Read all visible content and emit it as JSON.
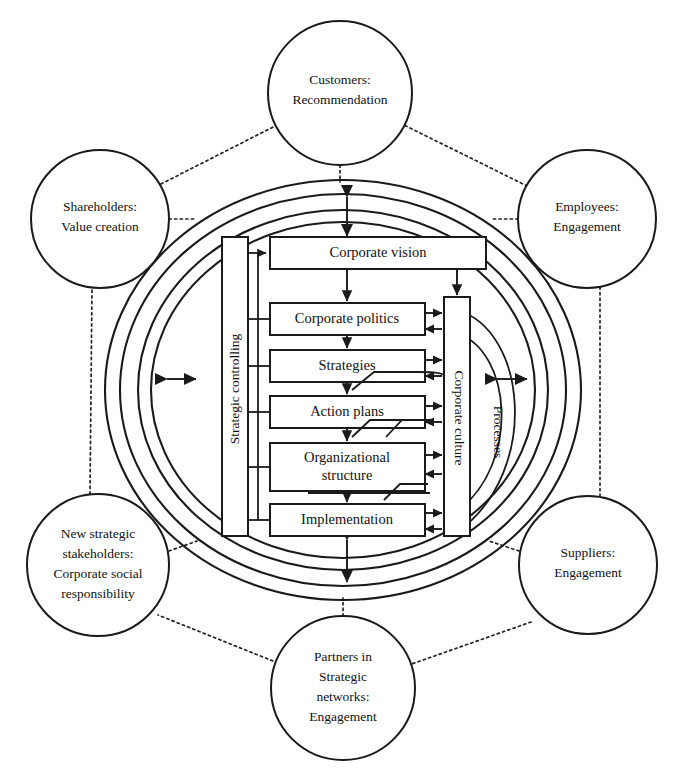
{
  "diagram": {
    "colors": {
      "stroke": "#1a1a1a",
      "background": "#ffffff",
      "text": "#111111"
    },
    "outer_circles": [
      {
        "id": "customers",
        "lines": [
          "Customers:",
          "Recommendation"
        ],
        "cx": 340,
        "cy": 93,
        "r": 72
      },
      {
        "id": "shareholders",
        "lines": [
          "Shareholders:",
          "Value creation"
        ],
        "cx": 100,
        "cy": 219,
        "r": 69
      },
      {
        "id": "employees",
        "lines": [
          "Employees:",
          "Engagement"
        ],
        "cx": 587,
        "cy": 219,
        "r": 69
      },
      {
        "id": "new-strategic-stakeholders",
        "lines": [
          "New strategic",
          "stakeholders:",
          "Corporate social",
          "responsibility"
        ],
        "cx": 98,
        "cy": 565,
        "r": 71
      },
      {
        "id": "suppliers",
        "lines": [
          "Suppliers:",
          "Engagement"
        ],
        "cx": 588,
        "cy": 565,
        "r": 69
      },
      {
        "id": "partners",
        "lines": [
          "Partners in",
          "Strategic",
          "networks:",
          "Engagement"
        ],
        "cx": 343,
        "cy": 688,
        "r": 72
      }
    ],
    "rings": [
      {
        "id": "ring-outer-edge",
        "rx": 238,
        "ry": 210
      },
      {
        "id": "ring-outer-inner",
        "rx": 223,
        "ry": 196
      },
      {
        "id": "ring-inner-edge",
        "rx": 205,
        "ry": 180
      },
      {
        "id": "ring-inner-inner",
        "rx": 192,
        "ry": 168
      }
    ],
    "core_boxes": [
      {
        "id": "corporate-vision",
        "lines": [
          "Corporate vision"
        ],
        "x": 270,
        "y": 237,
        "w": 216,
        "h": 32
      },
      {
        "id": "corporate-politics",
        "lines": [
          "Corporate politics"
        ],
        "x": 270,
        "y": 303,
        "w": 155,
        "h": 32
      },
      {
        "id": "strategies",
        "lines": [
          "Strategies"
        ],
        "x": 270,
        "y": 350,
        "w": 155,
        "h": 32
      },
      {
        "id": "action-plans",
        "lines": [
          "Action plans"
        ],
        "x": 270,
        "y": 396,
        "w": 155,
        "h": 32
      },
      {
        "id": "organizational-structure",
        "lines": [
          "Organizational",
          "structure"
        ],
        "x": 270,
        "y": 443,
        "w": 155,
        "h": 48
      },
      {
        "id": "implementation",
        "lines": [
          "Implementation"
        ],
        "x": 270,
        "y": 504,
        "w": 155,
        "h": 32
      }
    ],
    "vertical_bars": [
      {
        "id": "strategic-controlling",
        "label": "Strategic controlling",
        "x": 222,
        "y": 237,
        "w": 26,
        "h": 299,
        "direction": "bottom-up"
      },
      {
        "id": "corporate-culture",
        "label": "Corporate culture",
        "x": 444,
        "y": 297,
        "w": 26,
        "h": 239,
        "direction": "top-down"
      }
    ],
    "arc_label": {
      "id": "processes",
      "label": "Processes",
      "x": 495,
      "y": 430
    },
    "connector_arrows": {
      "top": {
        "id": "arrow-top",
        "orientation": "vertical",
        "double_headed": true
      },
      "bottom": {
        "id": "arrow-bottom",
        "orientation": "vertical",
        "double_headed": true
      },
      "left": {
        "id": "arrow-left",
        "orientation": "horizontal",
        "double_headed": true
      },
      "right": {
        "id": "arrow-right",
        "orientation": "horizontal",
        "double_headed": true
      }
    }
  }
}
